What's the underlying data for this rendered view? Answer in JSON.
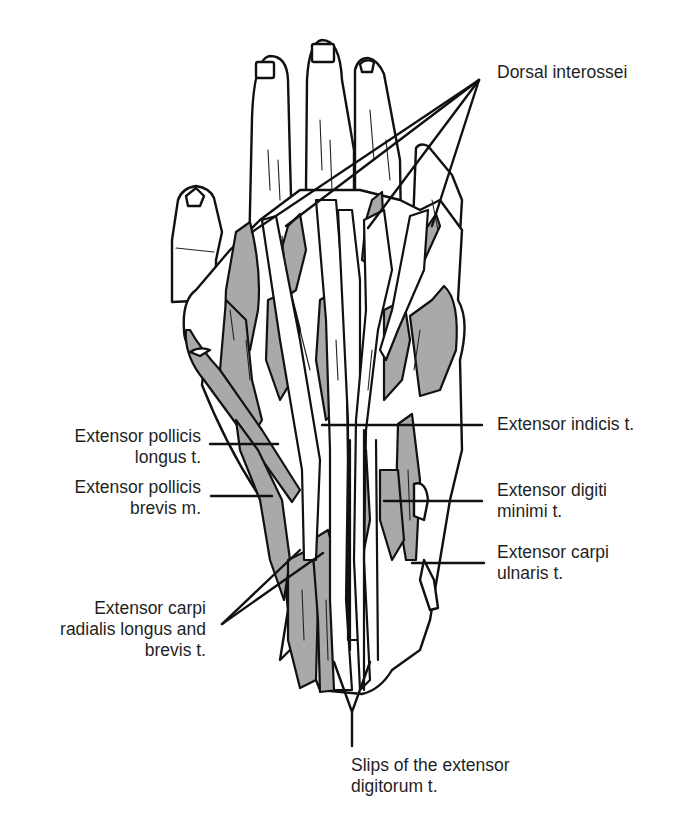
{
  "figure": {
    "colors": {
      "muscle_fill": "#a9a9a9",
      "tendon_fill": "#ffffff",
      "outline": "#111111",
      "text": "#1f1f1f"
    }
  },
  "labels": {
    "dorsal_interossei": {
      "lines": [
        "Dorsal interossei"
      ]
    },
    "extensor_pollicis_longus": {
      "lines": [
        "Extensor pollicis",
        "longus t."
      ]
    },
    "extensor_pollicis_brevis": {
      "lines": [
        "Extensor pollicis",
        "brevis m."
      ]
    },
    "extensor_carpi_radialis": {
      "lines": [
        "Extensor carpi",
        "radialis longus and",
        "brevis t."
      ]
    },
    "extensor_indicis": {
      "lines": [
        "Extensor indicis t."
      ]
    },
    "extensor_digiti_minimi": {
      "lines": [
        "Extensor digiti",
        "minimi t."
      ]
    },
    "extensor_carpi_ulnaris": {
      "lines": [
        "Extensor carpi",
        "ulnaris t."
      ]
    },
    "slips_extensor_digitorum": {
      "lines": [
        "Slips of the extensor",
        "digitorum t."
      ]
    }
  }
}
